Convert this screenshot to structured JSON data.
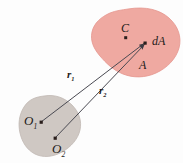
{
  "figure": {
    "background_color": "#fdfdfd"
  },
  "regions": [
    {
      "id": "area-A",
      "name": "area-region-A",
      "label": "A",
      "fill_color": "#efa9a1",
      "stroke_color": "#e0938b"
    },
    {
      "id": "origin-body",
      "name": "origin-body-region",
      "label": "",
      "fill_color": "#cfc8c3",
      "stroke_color": "#c2bab4"
    }
  ],
  "points": [
    {
      "id": "C",
      "label": "C",
      "x": 126,
      "y": 38,
      "dot_color": "#2a1f1c"
    },
    {
      "id": "dA",
      "label": "dA",
      "x": 145,
      "y": 43,
      "dot_color": "#2a1f1c"
    },
    {
      "id": "O1",
      "label": "O",
      "sub": "1",
      "x": 41,
      "y": 122,
      "dot_color": "#2a1f1c"
    },
    {
      "id": "O2",
      "label": "O",
      "sub": "2",
      "x": 55,
      "y": 138,
      "dot_color": "#2a1f1c"
    }
  ],
  "vectors": [
    {
      "id": "r1",
      "label": "r",
      "sub": "1",
      "from": "O1",
      "to": "dA",
      "x1": 41,
      "y1": 122,
      "x2": 145,
      "y2": 43,
      "color": "#4a4a52"
    },
    {
      "id": "r2",
      "label": "r",
      "sub": "2",
      "from": "O2",
      "to": "dA",
      "x1": 55,
      "y1": 138,
      "x2": 145,
      "y2": 43,
      "color": "#4a4a52"
    }
  ],
  "labels": {
    "centroid": "C",
    "element": "dA",
    "area": "A",
    "r1_base": "r",
    "r1_sub": "1",
    "r2_base": "r",
    "r2_sub": "2",
    "o1_base": "O",
    "o1_sub": "1",
    "o2_base": "O",
    "o2_sub": "2"
  },
  "colors": {
    "area_fill": "#efa9a1",
    "body_fill": "#cfc8c3",
    "vector_stroke": "#4a4a52",
    "point_dot": "#2a1f1c",
    "text": "#1d1b1a"
  }
}
